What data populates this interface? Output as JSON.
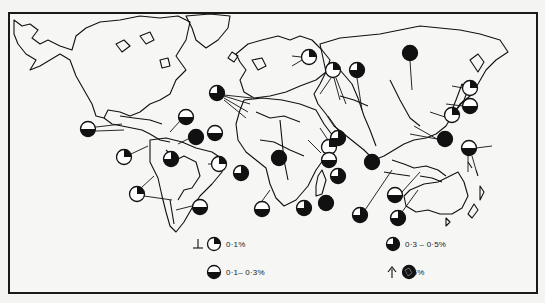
{
  "map": {
    "title": "",
    "background": "#f6f6f4",
    "ink": "#111111"
  },
  "legend": {
    "items": [
      {
        "symbol": "quarter-filled-circle",
        "label": "0·1%",
        "arrow": "down"
      },
      {
        "symbol": "half-filled-circle",
        "label": "0·1– 0·3%"
      },
      {
        "symbol": "three-quarter-filled-circle",
        "label": "0·3 – 0·5%"
      },
      {
        "symbol": "full-filled-circle",
        "label": "0·5%",
        "arrow": "up"
      }
    ]
  },
  "symbols": [
    {
      "region": "mexico-pacific",
      "x": 88,
      "y": 129,
      "type": "half"
    },
    {
      "region": "caribbean-north",
      "x": 186,
      "y": 117,
      "type": "half"
    },
    {
      "region": "caribbean",
      "x": 196,
      "y": 137,
      "type": "full"
    },
    {
      "region": "central-america",
      "x": 124,
      "y": 157,
      "type": "quarter"
    },
    {
      "region": "brazil-north",
      "x": 171,
      "y": 159,
      "type": "three-quarter"
    },
    {
      "region": "brazil-east",
      "x": 219,
      "y": 164,
      "type": "quarter"
    },
    {
      "region": "south-america-west",
      "x": 137,
      "y": 194,
      "type": "quarter"
    },
    {
      "region": "argentina",
      "x": 200,
      "y": 207,
      "type": "half"
    },
    {
      "region": "west-africa-north",
      "x": 215,
      "y": 133,
      "type": "half"
    },
    {
      "region": "iberia-atlantic",
      "x": 217,
      "y": 93,
      "type": "three-quarter"
    },
    {
      "region": "north-europe",
      "x": 309,
      "y": 57,
      "type": "quarter"
    },
    {
      "region": "east-europe",
      "x": 333,
      "y": 70,
      "type": "quarter"
    },
    {
      "region": "russia-west",
      "x": 357,
      "y": 70,
      "type": "three-quarter"
    },
    {
      "region": "siberia",
      "x": 410,
      "y": 53,
      "type": "full"
    },
    {
      "region": "west-africa",
      "x": 241,
      "y": 173,
      "type": "three-quarter"
    },
    {
      "region": "central-africa",
      "x": 279,
      "y": 158,
      "type": "full"
    },
    {
      "region": "horn-africa",
      "x": 329,
      "y": 147,
      "type": "quarter"
    },
    {
      "region": "east-africa",
      "x": 329,
      "y": 160,
      "type": "half"
    },
    {
      "region": "madagascar-north",
      "x": 338,
      "y": 176,
      "type": "three-quarter"
    },
    {
      "region": "southwest-africa",
      "x": 262,
      "y": 209,
      "type": "half"
    },
    {
      "region": "south-africa",
      "x": 304,
      "y": 208,
      "type": "three-quarter"
    },
    {
      "region": "indian-ocean",
      "x": 326,
      "y": 203,
      "type": "full"
    },
    {
      "region": "middle-east",
      "x": 338,
      "y": 138,
      "type": "three-quarter"
    },
    {
      "region": "india",
      "x": 372,
      "y": 162,
      "type": "full"
    },
    {
      "region": "southeast-asia",
      "x": 395,
      "y": 195,
      "type": "half"
    },
    {
      "region": "indonesia-west",
      "x": 360,
      "y": 215,
      "type": "three-quarter"
    },
    {
      "region": "indonesia-east",
      "x": 398,
      "y": 218,
      "type": "three-quarter"
    },
    {
      "region": "japan-north",
      "x": 470,
      "y": 88,
      "type": "quarter"
    },
    {
      "region": "japan",
      "x": 470,
      "y": 106,
      "type": "half"
    },
    {
      "region": "korea",
      "x": 452,
      "y": 115,
      "type": "quarter"
    },
    {
      "region": "philippines",
      "x": 445,
      "y": 139,
      "type": "full"
    },
    {
      "region": "pacific-islands",
      "x": 469,
      "y": 148,
      "type": "half"
    }
  ]
}
